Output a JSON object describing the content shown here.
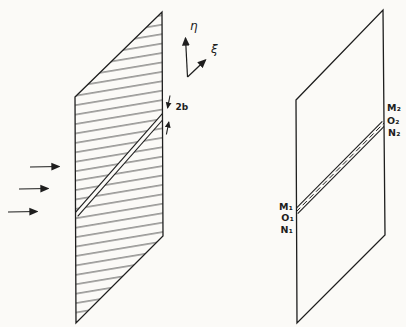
{
  "diagram": {
    "description_colors": {
      "paper": "#fbfaf7",
      "ink": "#1e1e1e",
      "hatch": "#3f3f3f"
    },
    "left_figure": {
      "axis_vertical_label": "η",
      "axis_oblique_label": "ξ",
      "slit_width_label": "2b",
      "flow_arrow_count": 3
    },
    "right_figure": {
      "labels_lower_left": [
        "M₁",
        "O₁",
        "N₁"
      ],
      "labels_upper_right": [
        "M₂",
        "O₂",
        "N₂"
      ]
    }
  }
}
